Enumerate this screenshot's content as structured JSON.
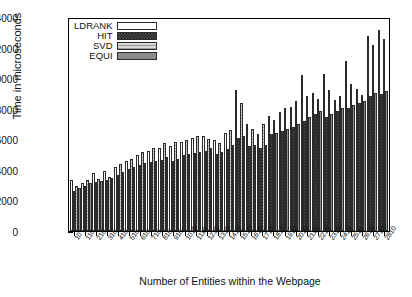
{
  "chart_data": {
    "type": "bar",
    "title": "",
    "xlabel": "Number of Entities within the Webpage",
    "ylabel": "Time in microseconds",
    "ylim": [
      0,
      14000
    ],
    "yticks": [
      0,
      2000,
      4000,
      6000,
      8000,
      10000,
      12000,
      14000
    ],
    "grid": false,
    "legend_position": "top-left",
    "categories": [
      "10",
      "110",
      "210",
      "310",
      "410",
      "510",
      "610",
      "710",
      "810",
      "910",
      "1010",
      "1110",
      "1210",
      "1310",
      "1410",
      "1510",
      "1610",
      "1710",
      "1810",
      "1910",
      "2010",
      "2110",
      "2210",
      "2310",
      "2410",
      "2510",
      "2610",
      "2710",
      "2810"
    ],
    "series": [
      {
        "name": "LDRANK",
        "fill": "white",
        "values": [
          3350,
          3150,
          3800,
          3950,
          4250,
          4600,
          5050,
          5300,
          5500,
          5600,
          5900,
          6150,
          6300,
          6000,
          6500,
          9300,
          7100,
          6400,
          7600,
          7850,
          8200,
          10300,
          9100,
          10400,
          8650,
          11200,
          9400,
          12900,
          13300
        ]
      },
      {
        "name": "HIT",
        "fill": "dark-crosshatch",
        "values": [
          2650,
          2950,
          3250,
          3400,
          3700,
          4100,
          4350,
          4550,
          4700,
          4600,
          5000,
          5150,
          5300,
          5100,
          5400,
          6150,
          5600,
          5500,
          6400,
          6600,
          6850,
          7250,
          7700,
          7550,
          7900,
          8150,
          8450,
          8900,
          9050
        ]
      },
      {
        "name": "SVD",
        "fill": "light-hatch",
        "values": [
          3000,
          3400,
          3450,
          3600,
          4400,
          4750,
          5200,
          5450,
          5800,
          5850,
          6000,
          6300,
          6100,
          5800,
          6650,
          8450,
          6750,
          7100,
          7300,
          8100,
          8600,
          8900,
          8700,
          9300,
          8900,
          9700,
          9000,
          12300,
          12700
        ]
      },
      {
        "name": "EQUI",
        "fill": "solid-gray",
        "values": [
          2850,
          3150,
          3300,
          3500,
          3900,
          4200,
          4500,
          4650,
          4900,
          4750,
          5100,
          5250,
          5450,
          5200,
          5650,
          6300,
          5700,
          5650,
          6500,
          6750,
          7050,
          7500,
          7900,
          7750,
          8100,
          8350,
          8600,
          9100,
          9250
        ]
      }
    ]
  },
  "legend": {
    "entries": [
      {
        "label": "LDRANK"
      },
      {
        "label": "HIT"
      },
      {
        "label": "SVD"
      },
      {
        "label": "EQUI"
      }
    ]
  }
}
